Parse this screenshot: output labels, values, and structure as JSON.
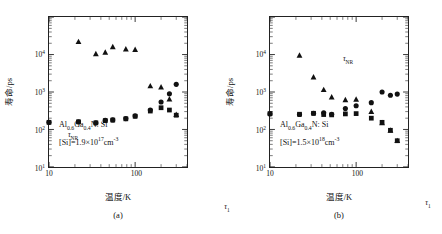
{
  "figure": {
    "panels": [
      {
        "id": "a",
        "caption": "(a)",
        "material": "Al0.6Ga0.4N: Si",
        "material_parts": {
          "pre": "Al",
          "sub1": "0.6",
          "mid": "Ga",
          "sub2": "0.4",
          "post": "N: Si"
        },
        "doping_label": "[Si]=1.9×10",
        "doping_exp": "17",
        "doping_unit": "cm",
        "doping_unit_exp": "-3",
        "annotations": [
          {
            "name": "tau-nr",
            "text": "τ",
            "sub": "NR",
            "x": 24,
            "y": 118
          },
          {
            "name": "tau-r",
            "text": "τ",
            "sub": "R",
            "x": 258,
            "y": 16.5
          },
          {
            "name": "tau-1",
            "text": "τ",
            "sub": "1",
            "x": 178,
            "y": 190
          }
        ],
        "chart_data": {
          "type": "scatter",
          "title": "",
          "xlabel": "温度/K",
          "ylabel": "寿命/ps",
          "xscale": "log",
          "yscale": "log",
          "xlim": [
            10,
            400
          ],
          "ylim": [
            10,
            100000
          ],
          "xticks": [
            10,
            100
          ],
          "xticklabels": [
            "10",
            "100"
          ],
          "yticks": [
            10,
            100,
            1000,
            10000
          ],
          "yticklabels": [
            "10^1",
            "10^2",
            "10^3",
            "10^4"
          ],
          "grid": false,
          "legend": "none",
          "series": [
            {
              "name": "τNR",
              "marker": "triangle",
              "points": [
                {
                  "x": 22,
                  "y": 22000
                },
                {
                  "x": 35,
                  "y": 10500
                },
                {
                  "x": 45,
                  "y": 11500
                },
                {
                  "x": 55,
                  "y": 16000
                },
                {
                  "x": 78,
                  "y": 14000
                },
                {
                  "x": 100,
                  "y": 13500
                },
                {
                  "x": 150,
                  "y": 1450
                },
                {
                  "x": 200,
                  "y": 1350
                },
                {
                  "x": 250,
                  "y": 650
                },
                {
                  "x": 300,
                  "y": 250
                }
              ]
            },
            {
              "name": "τR",
              "marker": "circle",
              "points": [
                {
                  "x": 10,
                  "y": 155
                },
                {
                  "x": 22,
                  "y": 160
                },
                {
                  "x": 35,
                  "y": 150
                },
                {
                  "x": 45,
                  "y": 175
                },
                {
                  "x": 55,
                  "y": 180
                },
                {
                  "x": 78,
                  "y": 195
                },
                {
                  "x": 100,
                  "y": 230
                },
                {
                  "x": 150,
                  "y": 330
                },
                {
                  "x": 200,
                  "y": 540
                },
                {
                  "x": 250,
                  "y": 900
                },
                {
                  "x": 300,
                  "y": 1600
                }
              ]
            },
            {
              "name": "τ1",
              "marker": "square",
              "points": [
                {
                  "x": 10,
                  "y": 155
                },
                {
                  "x": 22,
                  "y": 160
                },
                {
                  "x": 35,
                  "y": 150
                },
                {
                  "x": 45,
                  "y": 172
                },
                {
                  "x": 55,
                  "y": 178
                },
                {
                  "x": 78,
                  "y": 192
                },
                {
                  "x": 100,
                  "y": 225
                },
                {
                  "x": 150,
                  "y": 310
                },
                {
                  "x": 200,
                  "y": 380
                },
                {
                  "x": 250,
                  "y": 330
                },
                {
                  "x": 300,
                  "y": 240
                }
              ]
            }
          ]
        }
      },
      {
        "id": "b",
        "caption": "(b)",
        "material": "Al0.6Ga0.4N: Si",
        "material_parts": {
          "pre": "Al",
          "sub1": "0.6",
          "mid": "Ga",
          "sub2": "0.4",
          "post": "N: Si"
        },
        "doping_label": "[Si]=1.5×10",
        "doping_exp": "18",
        "doping_unit": "cm",
        "doping_unit_exp": "-3",
        "annotations": [
          {
            "name": "tau-nr",
            "text": "τ",
            "sub": "NR",
            "x": 78,
            "y": 42
          },
          {
            "name": "tau-r",
            "text": "τ",
            "sub": "R",
            "x": 256,
            "y": 57
          },
          {
            "name": "tau-1",
            "text": "τ",
            "sub": "1",
            "x": 158,
            "y": 186
          }
        ],
        "chart_data": {
          "type": "scatter",
          "title": "",
          "xlabel": "温度/K",
          "ylabel": "寿命/ps",
          "xscale": "log",
          "yscale": "log",
          "xlim": [
            10,
            400
          ],
          "ylim": [
            10,
            100000
          ],
          "xticks": [
            10,
            100
          ],
          "xticklabels": [
            "10",
            "100"
          ],
          "yticks": [
            10,
            100,
            1000,
            10000
          ],
          "yticklabels": [
            "10^1",
            "10^2",
            "10^3",
            "10^4"
          ],
          "grid": false,
          "legend": "none",
          "series": [
            {
              "name": "τNR",
              "marker": "triangle",
              "points": [
                {
                  "x": 22,
                  "y": 9500
                },
                {
                  "x": 32,
                  "y": 2500
                },
                {
                  "x": 42,
                  "y": 1150
                },
                {
                  "x": 52,
                  "y": 730
                },
                {
                  "x": 75,
                  "y": 620
                },
                {
                  "x": 100,
                  "y": 640
                },
                {
                  "x": 150,
                  "y": 300
                },
                {
                  "x": 200,
                  "y": 150
                },
                {
                  "x": 250,
                  "y": 95
                },
                {
                  "x": 300,
                  "y": 50
                }
              ]
            },
            {
              "name": "τR",
              "marker": "circle",
              "points": [
                {
                  "x": 10,
                  "y": 260
                },
                {
                  "x": 22,
                  "y": 250
                },
                {
                  "x": 32,
                  "y": 270
                },
                {
                  "x": 42,
                  "y": 280
                },
                {
                  "x": 52,
                  "y": 255
                },
                {
                  "x": 75,
                  "y": 360
                },
                {
                  "x": 100,
                  "y": 430
                },
                {
                  "x": 150,
                  "y": 520
                },
                {
                  "x": 200,
                  "y": 1000
                },
                {
                  "x": 250,
                  "y": 820
                },
                {
                  "x": 300,
                  "y": 880
                }
              ]
            },
            {
              "name": "τ1",
              "marker": "square",
              "points": [
                {
                  "x": 10,
                  "y": 265
                },
                {
                  "x": 22,
                  "y": 255
                },
                {
                  "x": 32,
                  "y": 270
                },
                {
                  "x": 42,
                  "y": 250
                },
                {
                  "x": 52,
                  "y": 245
                },
                {
                  "x": 75,
                  "y": 260
                },
                {
                  "x": 100,
                  "y": 265
                },
                {
                  "x": 150,
                  "y": 200
                },
                {
                  "x": 200,
                  "y": 155
                },
                {
                  "x": 250,
                  "y": 95
                },
                {
                  "x": 300,
                  "y": 50
                }
              ]
            }
          ]
        }
      }
    ]
  },
  "style": {
    "marker_color": "#111111",
    "axis_color": "#222222",
    "background": "#ffffff"
  }
}
